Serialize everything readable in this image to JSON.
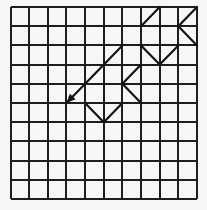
{
  "grid": {
    "columns": 10,
    "rows": 10,
    "line_color": "#1e1e1e",
    "background": "#f6f6f6"
  },
  "path": {
    "color": "#141414",
    "segments": [
      {
        "points": [
          [
            10,
            0
          ],
          [
            9,
            1
          ],
          [
            10,
            2
          ]
        ]
      },
      {
        "points": [
          [
            8,
            0
          ],
          [
            7,
            1
          ]
        ]
      },
      {
        "points": [
          [
            7,
            2
          ],
          [
            8,
            3
          ],
          [
            9,
            2
          ]
        ]
      },
      {
        "points": [
          [
            6,
            2
          ],
          [
            3,
            5
          ]
        ],
        "arrow_end": true
      },
      {
        "points": [
          [
            7,
            3
          ],
          [
            6,
            4
          ],
          [
            7,
            5
          ]
        ]
      },
      {
        "points": [
          [
            4,
            5
          ],
          [
            5,
            6
          ],
          [
            6,
            5
          ]
        ]
      }
    ]
  }
}
